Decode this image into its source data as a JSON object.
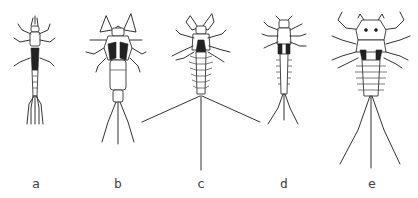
{
  "figure": {
    "background": "#ffffff",
    "ink": "#333333",
    "specimens": [
      {
        "id": "a",
        "label": "a",
        "cx": 36
      },
      {
        "id": "b",
        "label": "b",
        "cx": 118
      },
      {
        "id": "c",
        "label": "c",
        "cx": 201
      },
      {
        "id": "d",
        "label": "d",
        "cx": 284
      },
      {
        "id": "e",
        "label": "e",
        "cx": 372
      }
    ]
  }
}
